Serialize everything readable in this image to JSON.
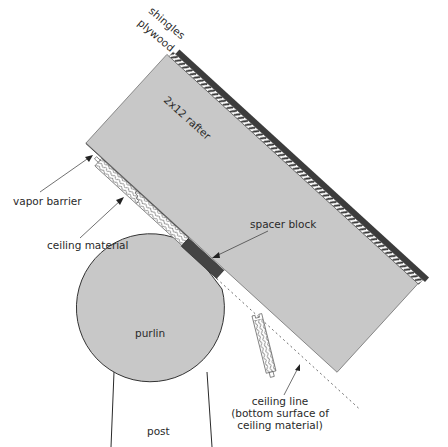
{
  "diagram": {
    "colors": {
      "wood": "#c8c8c8",
      "outline": "#3a3a3a",
      "shingles": "#3c3c3c",
      "spacer": "#444444",
      "background": "#ffffff"
    },
    "labels": {
      "shingles": "shingles",
      "plywood": "plywood",
      "rafter": "2x12 rafter",
      "vapor_barrier": "vapor barrier",
      "ceiling_material": "ceiling material",
      "spacer_block": "spacer block",
      "purlin": "purlin",
      "post": "post",
      "ceiling_line_1": "ceiling line",
      "ceiling_line_2": "(bottom surface of",
      "ceiling_line_3": "ceiling material)"
    }
  }
}
